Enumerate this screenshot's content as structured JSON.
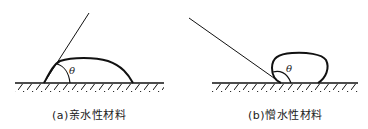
{
  "figure": {
    "panels": [
      {
        "id": "a",
        "caption": "(a)亲水性材料",
        "angle_label": "θ",
        "material": "hydrophilic"
      },
      {
        "id": "b",
        "caption": "(b)憎水性材料",
        "angle_label": "θ",
        "material": "hydrophobic"
      }
    ]
  },
  "colors": {
    "line": "#111111",
    "background": "#ffffff"
  }
}
